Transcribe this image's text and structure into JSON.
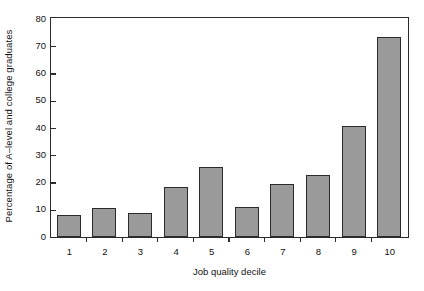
{
  "chart_data": {
    "type": "bar",
    "title": "",
    "xlabel": "Job quality decile",
    "ylabel": "Percentage of A–level and college graduates",
    "categories": [
      "1",
      "2",
      "3",
      "4",
      "5",
      "6",
      "7",
      "8",
      "9",
      "10"
    ],
    "values": [
      8.0,
      10.8,
      8.8,
      18.2,
      25.8,
      11.0,
      19.5,
      22.7,
      40.7,
      73.5
    ],
    "ylim": [
      0,
      80
    ],
    "ytick_labels": [
      "0",
      "10",
      "20",
      "30",
      "40",
      "50",
      "60",
      "70",
      "80"
    ],
    "ytick_values": [
      0,
      10,
      20,
      30,
      40,
      50,
      60,
      70,
      80
    ],
    "grid": false,
    "legend": false,
    "legend_position": "none",
    "bar_color": "#9a9a9a",
    "bar_edge_color": "#2b2b2b",
    "axis_color": "#2b2b2b",
    "background_color": "#ffffff",
    "text_color": "#111111"
  }
}
